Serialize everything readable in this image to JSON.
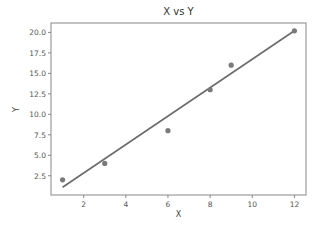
{
  "chart_data": {
    "type": "scatter",
    "title": "X vs Y",
    "xlabel": "X",
    "ylabel": "Y",
    "x": [
      1,
      3,
      6,
      8,
      9,
      12
    ],
    "y": [
      2,
      4,
      8,
      13,
      16,
      20.2
    ],
    "fit_line": {
      "x": [
        1,
        12
      ],
      "y": [
        1.1,
        20.2
      ]
    },
    "xticks": [
      2,
      4,
      6,
      8,
      10,
      12
    ],
    "yticks": [
      "2.5",
      "5.0",
      "7.5",
      "10.0",
      "12.5",
      "15.0",
      "17.5",
      "20.0"
    ],
    "xlim": [
      0.45,
      12.55
    ],
    "ylim": [
      0.15,
      21.15
    ],
    "grid": false,
    "legend": null,
    "colors": {
      "points": "#7a7a7a",
      "line": "#6b6b6b",
      "axes": "#888888"
    }
  }
}
